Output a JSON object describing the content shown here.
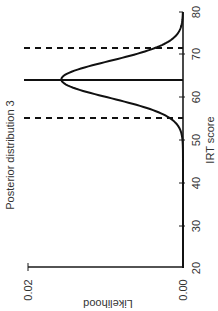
{
  "chart_data": {
    "type": "line",
    "title": "Posterior distribution 3",
    "xlabel": "IRT score",
    "ylabel": "Likelihood",
    "xlim": [
      20,
      80
    ],
    "ylim": [
      0.0,
      0.02
    ],
    "x_ticks": [
      20,
      30,
      40,
      50,
      60,
      70,
      80
    ],
    "y_ticks": [
      "0.00",
      "0.02"
    ],
    "grid": false,
    "legend": null,
    "orientation": "rotated 90 degrees clockwise",
    "series": [
      {
        "name": "posterior density",
        "style": "solid curve",
        "mean": 64.2,
        "sd": 4.3,
        "peak_likelihood": 0.0157,
        "x": [
          20,
          30,
          40,
          50,
          52,
          54,
          56,
          58,
          60,
          62,
          64,
          66,
          68,
          70,
          72,
          74,
          76,
          78,
          80
        ],
        "values": [
          0.0,
          0.0,
          0.0,
          0.0006,
          0.0014,
          0.0029,
          0.0052,
          0.0081,
          0.0113,
          0.0143,
          0.0157,
          0.0152,
          0.0127,
          0.0093,
          0.0058,
          0.0031,
          0.0014,
          0.0006,
          0.0002
        ]
      }
    ],
    "annotations": [
      {
        "type": "vertical-line",
        "style": "solid",
        "x": 64.2,
        "label": "posterior mean"
      },
      {
        "type": "vertical-line",
        "style": "dashed",
        "x": 55.3,
        "label": "lower bound"
      },
      {
        "type": "vertical-line",
        "style": "dashed",
        "x": 71.6,
        "label": "upper bound"
      }
    ]
  },
  "labels": {
    "title": "Posterior distribution 3",
    "xlabel": "IRT score",
    "ylabel": "Likelihood",
    "x_ticks": [
      "20",
      "30",
      "40",
      "50",
      "60",
      "70",
      "80"
    ],
    "y_ticks": [
      "0.00",
      "0.02"
    ]
  }
}
